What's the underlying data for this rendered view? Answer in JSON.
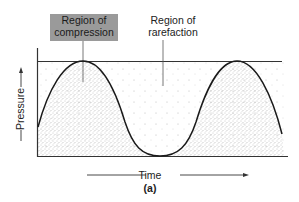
{
  "figure": {
    "labels": {
      "compression": "Region of compression",
      "compression_line1": "Region of",
      "compression_line2": "compression",
      "rarefaction_line1": "Region of",
      "rarefaction_line2": "rarefaction",
      "y_axis": "Pressure",
      "x_axis": "Time",
      "panel": "(a)"
    },
    "colors": {
      "label_box": "#9a9a9a",
      "curve": "#1a1a1a",
      "stipple": "#555555"
    },
    "wave": {
      "type": "sinusoid",
      "peaks_x": [
        83,
        237
      ],
      "trough_x": 160
    }
  }
}
